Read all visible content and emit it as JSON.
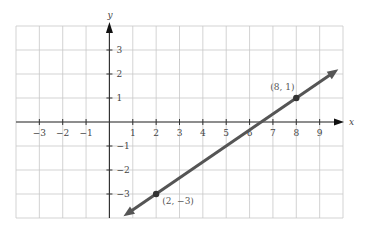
{
  "chart_data": {
    "type": "line",
    "title": "",
    "xlabel": "x",
    "ylabel": "y",
    "xlim": [
      -4,
      10
    ],
    "ylim": [
      -4,
      4
    ],
    "grid": true,
    "x_ticks": [
      -3,
      -2,
      -1,
      1,
      2,
      3,
      4,
      5,
      6,
      7,
      8,
      9
    ],
    "x_tick_labels": [
      "−3",
      "−2",
      "−1",
      "1",
      "2",
      "3",
      "4",
      "5",
      "6",
      "7",
      "8",
      "9"
    ],
    "y_ticks": [
      3,
      2,
      1,
      -1,
      -2,
      -3
    ],
    "y_tick_labels": [
      "3",
      "2",
      "1",
      "−1",
      "−2",
      "−3"
    ],
    "series": [
      {
        "name": "line through (2, −3) and (8, 1)",
        "equation": "y = (2/3)x − 13/3",
        "slope": 0.6667,
        "intercept": -4.3333,
        "x": [
          0.6,
          9.8
        ],
        "y": [
          -3.93,
          2.2
        ],
        "color": "#555555",
        "arrows": "both"
      }
    ],
    "points": [
      {
        "x": 2,
        "y": -3,
        "label": "(2, −3)"
      },
      {
        "x": 8,
        "y": 1,
        "label": "(8, 1)"
      }
    ]
  },
  "colors": {
    "grid": "#c8c8c8",
    "axis": "#333333",
    "line": "#555555"
  }
}
